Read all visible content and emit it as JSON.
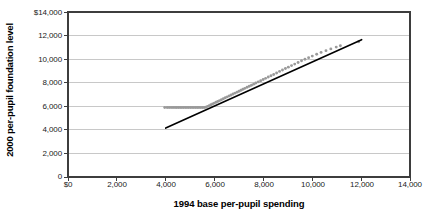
{
  "chart_data": {
    "type": "scatter",
    "title": "",
    "xlabel": "1994 base per-pupil spending",
    "ylabel": "2000 per-pupil foundation level",
    "xlim": [
      0,
      14000
    ],
    "ylim": [
      0,
      14000
    ],
    "grid": "horizontal",
    "legend": "none",
    "x_tick_labels": [
      "$0",
      "2,000",
      "4,000",
      "6,000",
      "8,000",
      "10,000",
      "12,000",
      "14,000"
    ],
    "x_tick_values": [
      0,
      2000,
      4000,
      6000,
      8000,
      10000,
      12000,
      14000
    ],
    "y_tick_labels": [
      "$14,000",
      "12,000",
      "10,000",
      "8,000",
      "6,000",
      "4,000",
      "2,000",
      "0"
    ],
    "y_tick_values": [
      14000,
      12000,
      10000,
      8000,
      6000,
      4000,
      2000,
      0
    ],
    "marker_color": "#9a9a9a",
    "trendline_color": "#000000",
    "gridline_color": "#c8c8c8",
    "axis_color": "#3d3d3d",
    "series": [
      {
        "name": "districts",
        "marker": "dot",
        "points": [
          [
            3960,
            5900
          ],
          [
            4060,
            5900
          ],
          [
            4140,
            5900
          ],
          [
            4220,
            5900
          ],
          [
            4300,
            5900
          ],
          [
            4380,
            5900
          ],
          [
            4450,
            5900
          ],
          [
            4520,
            5900
          ],
          [
            4590,
            5900
          ],
          [
            4660,
            5900
          ],
          [
            4730,
            5900
          ],
          [
            4800,
            5900
          ],
          [
            4870,
            5900
          ],
          [
            4940,
            5900
          ],
          [
            5010,
            5900
          ],
          [
            5080,
            5900
          ],
          [
            5150,
            5900
          ],
          [
            5220,
            5900
          ],
          [
            5290,
            5900
          ],
          [
            5360,
            5900
          ],
          [
            5430,
            5900
          ],
          [
            5500,
            5900
          ],
          [
            5570,
            5900
          ],
          [
            5640,
            5920
          ],
          [
            5710,
            5990
          ],
          [
            5780,
            6060
          ],
          [
            5850,
            6130
          ],
          [
            5920,
            6200
          ],
          [
            5990,
            6270
          ],
          [
            6060,
            6340
          ],
          [
            6130,
            6410
          ],
          [
            6200,
            6480
          ],
          [
            6280,
            6560
          ],
          [
            6360,
            6640
          ],
          [
            6440,
            6720
          ],
          [
            6520,
            6800
          ],
          [
            6600,
            6880
          ],
          [
            6680,
            6960
          ],
          [
            6760,
            7040
          ],
          [
            6840,
            7120
          ],
          [
            6920,
            7200
          ],
          [
            7000,
            7280
          ],
          [
            7080,
            7360
          ],
          [
            7160,
            7440
          ],
          [
            7240,
            7520
          ],
          [
            7330,
            7610
          ],
          [
            7420,
            7700
          ],
          [
            7510,
            7790
          ],
          [
            7600,
            7880
          ],
          [
            7690,
            7970
          ],
          [
            7790,
            8070
          ],
          [
            7890,
            8170
          ],
          [
            7990,
            8270
          ],
          [
            8090,
            8370
          ],
          [
            8200,
            8480
          ],
          [
            8310,
            8590
          ],
          [
            8420,
            8700
          ],
          [
            8540,
            8830
          ],
          [
            8660,
            8960
          ],
          [
            8780,
            9080
          ],
          [
            8900,
            9200
          ],
          [
            9020,
            9320
          ],
          [
            9150,
            9450
          ],
          [
            9280,
            9580
          ],
          [
            9420,
            9720
          ],
          [
            9560,
            9860
          ],
          [
            9700,
            9990
          ],
          [
            9850,
            10120
          ],
          [
            10000,
            10260
          ],
          [
            10180,
            10420
          ],
          [
            10360,
            10570
          ],
          [
            10560,
            10720
          ],
          [
            10760,
            10870
          ],
          [
            10980,
            11020
          ],
          [
            11150,
            11130
          ],
          [
            11900,
            11480
          ]
        ]
      }
    ],
    "trendline": {
      "name": "linear fit",
      "x_start": 4000,
      "y_start": 4150,
      "x_end": 12020,
      "y_end": 11650
    }
  },
  "axes": {
    "y_title": "2000 per-pupil foundation level",
    "x_title": "1994 base per-pupil spending"
  }
}
